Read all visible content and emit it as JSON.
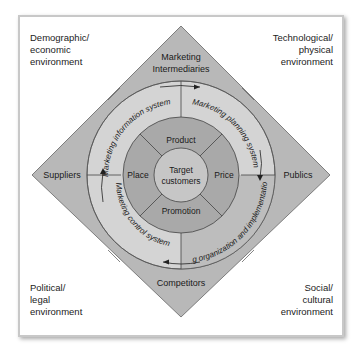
{
  "corners": {
    "top_left": [
      "Demographic/",
      "economic",
      "environment"
    ],
    "top_right": [
      "Technological/",
      "physical",
      "environment"
    ],
    "bottom_left": [
      "Political/",
      "legal",
      "environment"
    ],
    "bottom_right": [
      "Social/",
      "cultural",
      "environment"
    ]
  },
  "diamond": {
    "top": [
      "Marketing",
      "Intermediaries"
    ],
    "left": "Suppliers",
    "right": "Publics",
    "bottom": "Competitors"
  },
  "systems": {
    "info": "Marketing information system",
    "planning": "Marketing planning system",
    "org": "Marketing organization and implementation system",
    "control": "Marketing control system"
  },
  "four_ps": {
    "product": "Product",
    "price": "Price",
    "promotion": "Promotion",
    "place": "Place"
  },
  "center": [
    "Target",
    "customers"
  ],
  "colors": {
    "diamond": "#b4b4b4",
    "outer_ring": "#d2d2d2",
    "ps_ring": "#a8a8a8",
    "center": "#c4c4c4"
  }
}
